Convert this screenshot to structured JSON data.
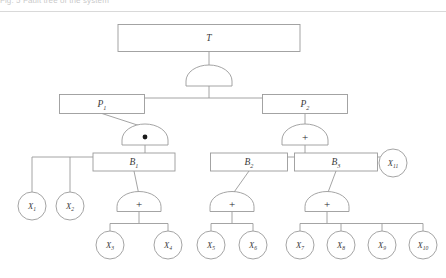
{
  "header": {
    "caption_fragment": "Fig. 5  Fault tree of the system",
    "divider": "horizontal-rule"
  },
  "diagram": {
    "title": "Fault tree",
    "stroke_color": "#9a9a9a",
    "text_color": "#3a3a3a",
    "fill_color": "#ffffff",
    "gate_symbols": {
      "and": "•",
      "or": "+",
      "blank": ""
    },
    "nodes": [
      {
        "id": "T",
        "label": "T",
        "type": "box",
        "x": 209,
        "y": 38,
        "w": 182,
        "h": 27
      },
      {
        "id": "P1",
        "label": "P",
        "sub": "1",
        "type": "box",
        "x": 102,
        "y": 104,
        "w": 85,
        "h": 19
      },
      {
        "id": "P2",
        "label": "P",
        "sub": "2",
        "type": "box",
        "x": 305,
        "y": 104,
        "w": 85,
        "h": 19
      },
      {
        "id": "B1",
        "label": "B",
        "sub": "1",
        "type": "box",
        "x": 134,
        "y": 162,
        "w": 82,
        "h": 18
      },
      {
        "id": "B2",
        "label": "B",
        "sub": "2",
        "type": "box",
        "x": 249,
        "y": 162,
        "w": 77,
        "h": 18
      },
      {
        "id": "B3",
        "label": "B",
        "sub": "3",
        "type": "box",
        "x": 336,
        "y": 162,
        "w": 83,
        "h": 18
      },
      {
        "id": "X11",
        "label": "X",
        "sub": "11",
        "type": "circle",
        "x": 393,
        "y": 163,
        "r": 14
      },
      {
        "id": "X1",
        "label": "X",
        "sub": "1",
        "type": "circle",
        "x": 32,
        "y": 206,
        "r": 14
      },
      {
        "id": "X2",
        "label": "X",
        "sub": "2",
        "type": "circle",
        "x": 70,
        "y": 206,
        "r": 14
      },
      {
        "id": "X3",
        "label": "X",
        "sub": "3",
        "type": "circle",
        "x": 110,
        "y": 245,
        "r": 14
      },
      {
        "id": "X4",
        "label": "X",
        "sub": "4",
        "type": "circle",
        "x": 168,
        "y": 245,
        "r": 14
      },
      {
        "id": "X5",
        "label": "X",
        "sub": "5",
        "type": "circle",
        "x": 211,
        "y": 245,
        "r": 14
      },
      {
        "id": "X6",
        "label": "X",
        "sub": "6",
        "type": "circle",
        "x": 253,
        "y": 245,
        "r": 14
      },
      {
        "id": "X7",
        "label": "X",
        "sub": "7",
        "type": "circle",
        "x": 300,
        "y": 245,
        "r": 14
      },
      {
        "id": "X8",
        "label": "X",
        "sub": "8",
        "type": "circle",
        "x": 341,
        "y": 245,
        "r": 14
      },
      {
        "id": "X9",
        "label": "X",
        "sub": "9",
        "type": "circle",
        "x": 382,
        "y": 245,
        "r": 14
      },
      {
        "id": "X10",
        "label": "X",
        "sub": "10",
        "type": "circle",
        "x": 423,
        "y": 245,
        "r": 14
      }
    ],
    "gates": [
      {
        "id": "G-T",
        "parent": "T",
        "symbol": "",
        "kind": "blank",
        "x": 209,
        "y": 77,
        "w": 46,
        "h": 18
      },
      {
        "id": "G-P1",
        "parent": "P1",
        "symbol": "•",
        "kind": "and",
        "x": 145,
        "y": 136,
        "w": 46,
        "h": 18
      },
      {
        "id": "G-P2",
        "parent": "P2",
        "symbol": "+",
        "kind": "or",
        "x": 305,
        "y": 136,
        "w": 46,
        "h": 18
      },
      {
        "id": "G-B1",
        "parent": "B1",
        "symbol": "+",
        "kind": "or",
        "x": 139,
        "y": 203,
        "w": 44,
        "h": 17
      },
      {
        "id": "G-B2",
        "parent": "B2",
        "symbol": "+",
        "kind": "or",
        "x": 232,
        "y": 203,
        "w": 44,
        "h": 17
      },
      {
        "id": "G-B3",
        "parent": "B3",
        "symbol": "+",
        "kind": "or",
        "x": 327,
        "y": 203,
        "w": 44,
        "h": 17
      }
    ],
    "edges": [
      {
        "from": "T",
        "to": [
          "P1",
          "P2"
        ]
      },
      {
        "from": "P1",
        "to": [
          "X1",
          "X2",
          "B1"
        ]
      },
      {
        "from": "B1",
        "to": [
          "X3",
          "X4"
        ]
      },
      {
        "from": "P2",
        "to": [
          "B2",
          "B3",
          "X11"
        ]
      },
      {
        "from": "B2",
        "to": [
          "X5",
          "X6"
        ]
      },
      {
        "from": "B3",
        "to": [
          "X7",
          "X8",
          "X9",
          "X10"
        ]
      }
    ]
  }
}
